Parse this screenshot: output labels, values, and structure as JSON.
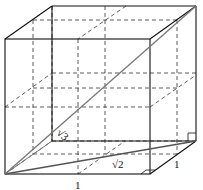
{
  "diagram": {
    "type": "cube",
    "subdivisions": 3,
    "labels": {
      "space_diagonal": "√3",
      "face_diagonal": "√2",
      "front_edge": "1",
      "side_edge": "1"
    },
    "colors": {
      "edge": "#111111",
      "diagonal": "#555555",
      "dashed": "#333333"
    }
  }
}
